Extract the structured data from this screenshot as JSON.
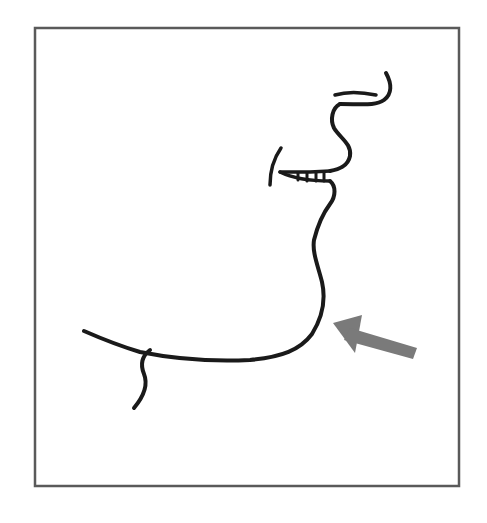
{
  "figure": {
    "frame_color": "#5a5a5a",
    "line_color": "#1a1a1a",
    "arrow_color": "#7a7a7a",
    "background_color": "#ffffff"
  },
  "elements": {
    "frame": {
      "label": "frame-border"
    },
    "profile": {
      "label": "face-profile"
    },
    "arrow": {
      "label": "pointer-arrow",
      "points_to": "jaw-neck angle"
    }
  }
}
